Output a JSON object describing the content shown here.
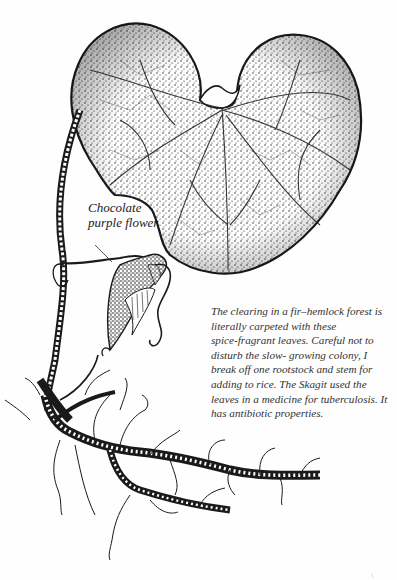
{
  "page": {
    "header_clipped": ""
  },
  "illustration": {
    "subject": "wild ginger plant with heart-shaped leaf, flower and rootstock",
    "ink_color": "#1a1a1a",
    "paper_color": "#fefefe"
  },
  "labels": {
    "flower_label": [
      "Chocolate",
      "purple flower"
    ]
  },
  "caption": {
    "lines": [
      "The clearing in a fir–hemlock forest is",
      "literally carpeted with these",
      "spice-fragrant leaves. Careful not to",
      "disturb the slow- growing colony, I",
      "break off one rootstock and stem for",
      "adding to rice. The Skagit used the",
      "leaves in a medicine for tuberculosis. It",
      "has antibiotic properties."
    ]
  }
}
